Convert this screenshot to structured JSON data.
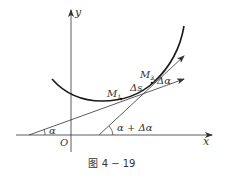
{
  "figure": {
    "caption": "图 4 − 19",
    "axes": {
      "x_label": "x",
      "y_label": "y",
      "origin_label": "O"
    },
    "points": {
      "m1": "M",
      "m1_sub": "1",
      "m2": "M",
      "m2_sub": "2"
    },
    "annotations": {
      "arc_length": "Δs",
      "angle_alpha": "α",
      "angle_alpha_plus": "α + Δα",
      "angle_delta": "Δα"
    },
    "colors": {
      "line": "#333333",
      "curve": "#1a1a1a",
      "background": "#ffffff"
    }
  }
}
